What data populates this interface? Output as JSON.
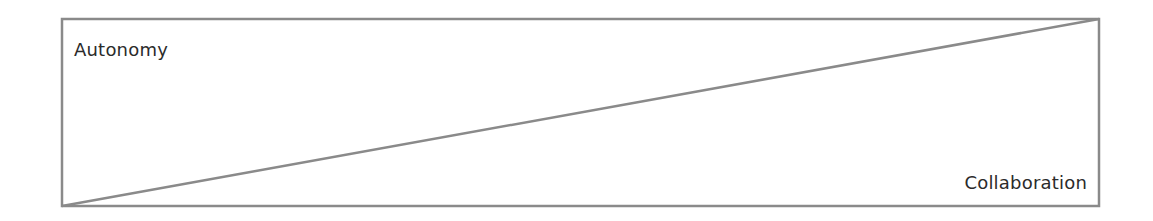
{
  "diagram": {
    "top_left_label": "Autonomy",
    "bottom_right_label": "Collaboration",
    "line_color": "#8a8a8a",
    "text_color": "#2b2b2b"
  }
}
